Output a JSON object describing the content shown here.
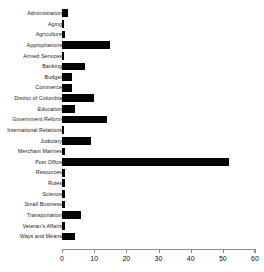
{
  "chart_data": {
    "type": "bar",
    "orientation": "horizontal",
    "title": "",
    "xlabel": "",
    "ylabel": "",
    "xlim": [
      0,
      60
    ],
    "xticks": [
      0,
      10,
      20,
      30,
      40,
      50,
      60
    ],
    "grid": false,
    "legend": null,
    "bar_color": "#000000",
    "axis_color": "#8d8d8d",
    "categories": [
      "Administration",
      "Aging",
      "Agriculture",
      "Appropriations",
      "Armed Services",
      "Banking",
      "Budget",
      "Commerce",
      "District of Columbia",
      "Education",
      "Government Reform",
      "International Relations",
      "Judiciary",
      "Merchant Marines",
      "Post Office",
      "Resources",
      "Rules",
      "Science",
      "Small Business",
      "Transportation",
      "Veteran's Affairs",
      "Ways and Means"
    ],
    "values": [
      2,
      0,
      1,
      15,
      0,
      7,
      3,
      3,
      10,
      4,
      14,
      0,
      9,
      1,
      52,
      1,
      1,
      1,
      1,
      6,
      1,
      4
    ]
  }
}
